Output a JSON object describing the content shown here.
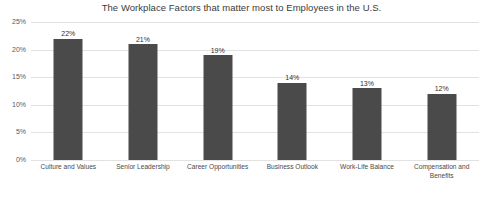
{
  "chart_data": {
    "type": "bar",
    "title": "The Workplace Factors that matter most to Employees in the U.S.",
    "xlabel": "",
    "ylabel": "",
    "categories": [
      "Culture and Values",
      "Senior Leadership",
      "Career Opportunities",
      "Business Outlook",
      "Work-Life Balance",
      "Compensation and Benefits"
    ],
    "values": [
      22,
      21,
      19,
      14,
      13,
      12
    ],
    "value_labels": [
      "22%",
      "21%",
      "19%",
      "14%",
      "13%",
      "12%"
    ],
    "ylim": [
      0,
      25
    ],
    "ytick_values": [
      0,
      5,
      10,
      15,
      20,
      25
    ],
    "ytick_labels": [
      "0%",
      "5%",
      "10%",
      "15%",
      "20%",
      "25%"
    ],
    "grid": true,
    "legend": false,
    "bar_color": "#4a4a4a",
    "gridline_color": "#e2e2e2",
    "background_color": "#ffffff",
    "title_color": "#3b3b3b"
  }
}
